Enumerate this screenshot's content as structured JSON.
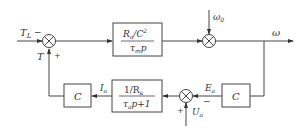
{
  "diagram": {
    "type": "control block diagram",
    "blocks": {
      "mech": {
        "num": "R",
        "num_sub": "a",
        "num_rest": "/C",
        "num_sup": "2",
        "den": "τ",
        "den_sub": "m",
        "den_rest": "p"
      },
      "elec": {
        "num": "1/R",
        "num_sub": "a",
        "den": "τ",
        "den_sub": "a",
        "den_rest": "p+1"
      },
      "c_left": {
        "label": "C"
      },
      "c_right": {
        "label": "C"
      }
    },
    "signals": {
      "tl": "T",
      "tl_sub": "L",
      "tl_sign": "−",
      "t": "T",
      "t_sign": "+",
      "omega0": "ω",
      "omega0_sub": "0",
      "omega": "ω",
      "ia": "I",
      "ia_sub": "a",
      "ea": "E",
      "ea_sub": "a",
      "ea_sign": "−",
      "ua": "U",
      "ua_sub": "a",
      "ua_sign": "+"
    }
  }
}
